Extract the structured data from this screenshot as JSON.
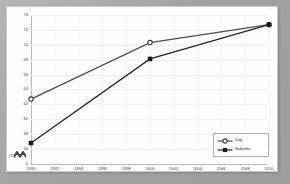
{
  "chart_data": {
    "type": "line",
    "title": "",
    "xlabel": "",
    "ylabel": "(%)",
    "x": [
      1990,
      2000,
      2010
    ],
    "categories": [
      "1990",
      "2000",
      "2010"
    ],
    "series": [
      {
        "name": "City",
        "values": [
          62.7,
          70.3,
          72.7
        ],
        "marker": "open-circle",
        "color": "#4d4d4d"
      },
      {
        "name": "Suburbs",
        "values": [
          56.8,
          68.1,
          72.7
        ],
        "marker": "filled-square",
        "color": "#262626"
      }
    ],
    "xlim": [
      1990,
      2010
    ],
    "ylim": [
      56,
      74
    ],
    "ytick_labels": [
      "74",
      "72",
      "70",
      "68",
      "66",
      "64",
      "62",
      "60",
      "58",
      "56"
    ],
    "ytick_values": [
      74,
      72,
      70,
      68,
      66,
      64,
      62,
      60,
      58,
      56
    ],
    "xtick_labels": [
      "1990",
      "1992",
      "1994",
      "1996",
      "1998",
      "2000",
      "2002",
      "2004",
      "2006",
      "2008",
      "2010"
    ],
    "xtick_values": [
      1990,
      1992,
      1994,
      1996,
      1998,
      2000,
      2002,
      2004,
      2006,
      2008,
      2010
    ],
    "axis_break_label": "0",
    "axis_break_icon": "axis-break-zigzag",
    "grid": true,
    "legend_position": "bottom-right",
    "legend_entries": [
      "City",
      "Suburbs"
    ],
    "colors": {
      "city_line": "#4d4d4d",
      "suburbs_line": "#262626",
      "gridline": "#eef0f2",
      "axis": "#b9b9b9",
      "plot_background": "#fefefe",
      "frame": "#a8a8a8"
    }
  }
}
